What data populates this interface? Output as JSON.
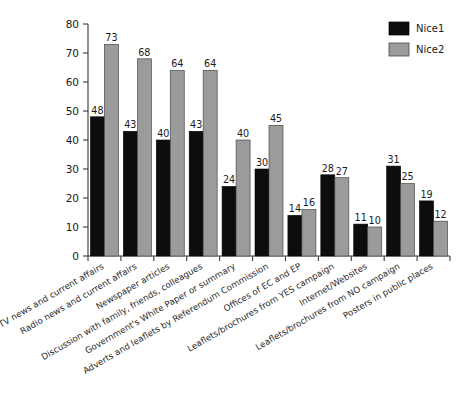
{
  "chart_data": {
    "type": "bar",
    "title": "",
    "xlabel": "",
    "ylabel": "",
    "ylim": [
      0,
      80
    ],
    "yticks": [
      0,
      10,
      20,
      30,
      40,
      50,
      60,
      70,
      80
    ],
    "grid": false,
    "legend_position": "top-right",
    "value_labels": true,
    "categories": [
      "TV news and current affairs",
      "Radio news and current affairs",
      "Newspaper articles",
      "Discussion with family, friends, colleagues",
      "Government's White Paper or summary",
      "Adverts and leaflets by Referendum Commission",
      "Offices of EC and EP",
      "Leaflets/brochures from YES campaign",
      "Internet/Websites",
      "Leaflets/brochures from NO campaign",
      "Posters in public places"
    ],
    "series": [
      {
        "name": "Nice1",
        "color": "#0d0d0d",
        "values": [
          48,
          43,
          40,
          43,
          24,
          30,
          14,
          28,
          11,
          31,
          19
        ]
      },
      {
        "name": "Nice2",
        "color": "#9b9b9b",
        "values": [
          73,
          68,
          64,
          64,
          40,
          45,
          16,
          27,
          10,
          25,
          12
        ]
      }
    ]
  },
  "legend": {
    "items": [
      {
        "label": "Nice1",
        "swatch": "#0d0d0d"
      },
      {
        "label": "Nice2",
        "swatch": "#9b9b9b"
      }
    ]
  }
}
